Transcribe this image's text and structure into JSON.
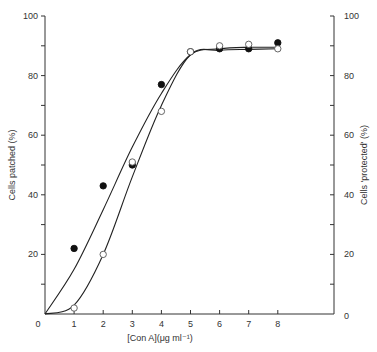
{
  "chart_data": {
    "type": "line",
    "title": "",
    "xlabel": "[Con A](μg ml⁻¹)",
    "ylabel": "Cells patched (%)",
    "y2label": "Cells 'protected' (%)",
    "xlim": [
      0,
      9.4
    ],
    "ylim": [
      0,
      100
    ],
    "y2lim": [
      0,
      100
    ],
    "x_ticks": [
      "0",
      "1",
      "2",
      "3",
      "4",
      "5",
      "6",
      "7",
      "8"
    ],
    "y_ticks": [
      "20",
      "40",
      "60",
      "80",
      "100"
    ],
    "y2_ticks": [
      "0",
      "20",
      "40",
      "60",
      "80",
      "100"
    ],
    "grid": false,
    "legend": null,
    "x": [
      1,
      2,
      3,
      4,
      5,
      6,
      7,
      8
    ],
    "series": [
      {
        "name": "Cells patched (filled circles)",
        "marker": "filled-circle",
        "axis": "left",
        "values": [
          22,
          43,
          50,
          77,
          88,
          89,
          89,
          91
        ]
      },
      {
        "name": "Cells 'protected' (open circles)",
        "marker": "open-circle",
        "axis": "right",
        "values": [
          2,
          20,
          51,
          68,
          88,
          90,
          90.5,
          89
        ]
      }
    ],
    "fitted_curves": [
      {
        "name": "patched-fit",
        "points": [
          [
            0,
            0
          ],
          [
            1,
            15
          ],
          [
            2,
            35
          ],
          [
            3,
            56
          ],
          [
            4,
            74
          ],
          [
            5,
            87
          ],
          [
            6,
            89
          ],
          [
            7,
            89.5
          ],
          [
            8,
            89.5
          ]
        ]
      },
      {
        "name": "protected-fit",
        "points": [
          [
            0,
            0
          ],
          [
            1,
            3
          ],
          [
            2,
            20
          ],
          [
            3,
            46
          ],
          [
            4,
            70
          ],
          [
            5,
            87
          ],
          [
            6,
            88.5
          ],
          [
            7,
            88.8
          ],
          [
            8,
            89
          ]
        ]
      }
    ]
  }
}
